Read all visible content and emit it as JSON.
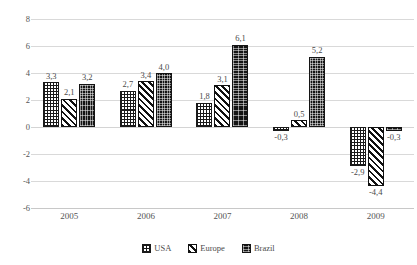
{
  "chart_data": {
    "type": "bar",
    "title": "",
    "subtitle": "",
    "xlabel": "",
    "ylabel": "",
    "categories": [
      "2005",
      "2006",
      "2007",
      "2008",
      "2009"
    ],
    "series": [
      {
        "name": "USA",
        "pattern": "grid",
        "color": "#1a1a1a",
        "values": [
          3.3,
          2.7,
          1.8,
          -0.3,
          -2.9
        ],
        "labels": [
          "3,3",
          "2,7",
          "1,8",
          "-0,3",
          "-2,9"
        ]
      },
      {
        "name": "Europe",
        "pattern": "diagonal-stripes",
        "color": "#111111",
        "values": [
          2.1,
          3.4,
          3.1,
          0.5,
          -4.4
        ],
        "labels": [
          "2,1",
          "3,4",
          "3,1",
          "0,5",
          "-4,4"
        ]
      },
      {
        "name": "Brazil",
        "pattern": "stipple-dark",
        "color": "#141414",
        "values": [
          3.2,
          4.0,
          6.1,
          5.2,
          -0.3
        ],
        "labels": [
          "3,2",
          "4,0",
          "6,1",
          "5,2",
          "-0,3"
        ]
      }
    ],
    "ylim": [
      -6,
      8
    ],
    "ytick_values": [
      8,
      6,
      4,
      2,
      0,
      -2,
      -4,
      -6
    ],
    "ytick_labels": [
      "8",
      "6",
      "4",
      "2",
      "0",
      "-2",
      "-4",
      "-6"
    ],
    "grid": true,
    "legend_position": "bottom",
    "decimal_separator": ","
  },
  "legend": {
    "items": [
      {
        "label": "USA"
      },
      {
        "label": "Europe"
      },
      {
        "label": "Brazil"
      }
    ]
  }
}
